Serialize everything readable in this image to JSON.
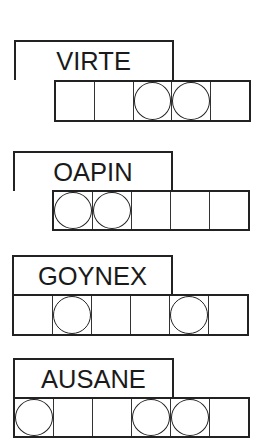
{
  "puzzle": {
    "type": "word-jumble",
    "words": [
      {
        "scrambled": "VIRTE",
        "letters": 5,
        "circled": [
          false,
          false,
          true,
          true,
          false
        ]
      },
      {
        "scrambled": "OAPIN",
        "letters": 5,
        "circled": [
          true,
          true,
          false,
          false,
          false
        ]
      },
      {
        "scrambled": "GOYNEX",
        "letters": 6,
        "circled": [
          false,
          true,
          false,
          false,
          true,
          false
        ]
      },
      {
        "scrambled": "AUSANE",
        "letters": 6,
        "circled": [
          true,
          false,
          false,
          true,
          true,
          false
        ]
      }
    ]
  }
}
